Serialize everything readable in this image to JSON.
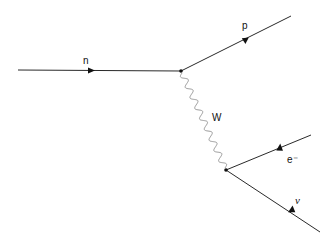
{
  "diagram": {
    "type": "feynman",
    "particles": {
      "incoming": "n",
      "outgoing_top": "p",
      "boson": "W",
      "lepton": "e⁻",
      "neutrino": "ν"
    },
    "colors": {
      "fermion_line": "#111111",
      "boson_line": "#999999"
    }
  }
}
